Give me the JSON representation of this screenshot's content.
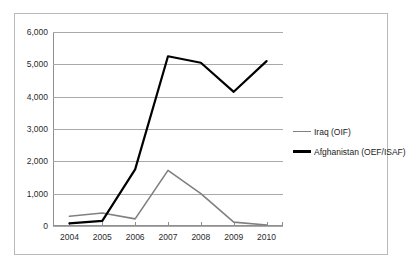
{
  "chart_data": {
    "type": "line",
    "title": "",
    "xlabel": "",
    "ylabel": "",
    "categories": [
      "2004",
      "2005",
      "2006",
      "2007",
      "2008",
      "2009",
      "2010"
    ],
    "x": [
      2004,
      2005,
      2006,
      2007,
      2008,
      2009,
      2010
    ],
    "series": [
      {
        "name": "Iraq (OIF)",
        "color": "#808080",
        "values": [
          300,
          400,
          220,
          1720,
          1000,
          120,
          30
        ]
      },
      {
        "name": "Afghanistan (OEF/ISAF)",
        "color": "#000000",
        "values": [
          80,
          160,
          1750,
          5250,
          5050,
          4150,
          5100
        ]
      }
    ],
    "ylim": [
      0,
      6000
    ],
    "ytick_values": [
      0,
      1000,
      2000,
      3000,
      4000,
      5000,
      6000
    ],
    "ytick_labels": [
      "0",
      "1,000",
      "2,000",
      "3,000",
      "4,000",
      "5,000",
      "6,000"
    ],
    "grid": true,
    "grid_axis": "y",
    "legend_position": "right",
    "legend": [
      "Iraq (OIF)",
      "Afghanistan (OEF/ISAF)"
    ]
  },
  "colors": {
    "frame_border": "#b9b9b9",
    "gridline": "#a9a9a9",
    "axis": "#8f8f8f",
    "text": "#2b2b2b",
    "iraq": "#808080",
    "afghanistan": "#000000",
    "background": "#ffffff"
  }
}
